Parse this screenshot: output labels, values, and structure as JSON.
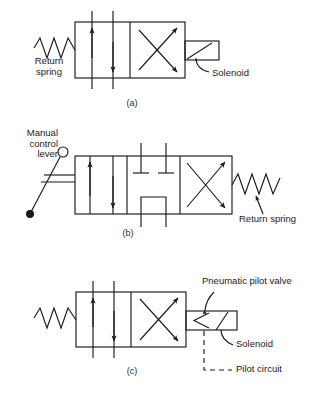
{
  "figure": {
    "background": "#ffffff",
    "line_color": "#1a1a1a"
  },
  "diagrams": [
    {
      "id": "a",
      "caption": "(a)",
      "description": "Two-position four-way valve, spring return, solenoid actuated",
      "positions": 2,
      "labels": {
        "return_spring": "Return\nspring",
        "solenoid": "Solenoid"
      }
    },
    {
      "id": "b",
      "caption": "(b)",
      "description": "Three-position four-way valve, manual lever actuated, spring return, closed centre",
      "positions": 3,
      "labels": {
        "manual_lever": "Manual\ncontrol\nlever",
        "return_spring": "Return spring"
      }
    },
    {
      "id": "c",
      "caption": "(c)",
      "description": "Two-position four-way valve, spring return, solenoid operated pneumatic pilot valve",
      "positions": 2,
      "labels": {
        "pneumatic_pilot_valve": "Pneumatic pilot valve",
        "solenoid": "Solenoid",
        "pilot_circuit": "Pilot circuit"
      }
    }
  ],
  "labels_flat": {
    "a_return_spring_line1": "Return",
    "a_return_spring_line2": "spring",
    "a_solenoid": "Solenoid",
    "a_caption": "(a)",
    "b_manual_line1": "Manual",
    "b_manual_line2": "control",
    "b_manual_line3": "lever",
    "b_return_spring": "Return spring",
    "b_caption": "(b)",
    "c_pneumatic_pilot_valve": "Pneumatic pilot valve",
    "c_solenoid": "Solenoid",
    "c_pilot_circuit": "Pilot circuit",
    "c_caption": "(c)"
  }
}
